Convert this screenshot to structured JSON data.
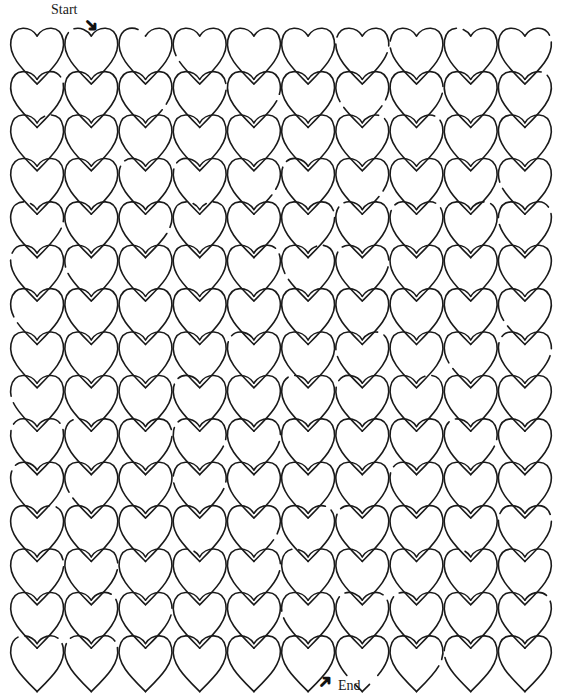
{
  "puzzle": {
    "type": "heart-maze",
    "start_label": "Start",
    "end_label": "End",
    "arrow_start_icon": "arrow-down-right-icon",
    "arrow_end_icon": "arrow-up-left-icon",
    "grid": {
      "rows": 15,
      "cols": 10
    },
    "start_opening": {
      "row": 0,
      "between_cols": [
        1,
        2
      ]
    },
    "end_opening": {
      "row": 14,
      "col": 6
    },
    "line_color": "#1a1a1a",
    "background": "#ffffff"
  }
}
